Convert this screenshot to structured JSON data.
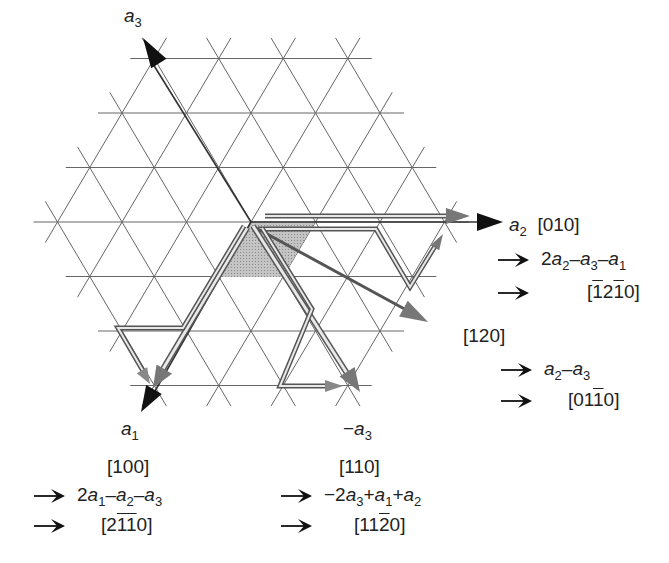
{
  "figure": {
    "lattice": {
      "type": "triangular",
      "center": [
        251,
        222
      ],
      "spacing_x": 64.5,
      "spacing_y": 54.5,
      "rings": 3,
      "line_color": "#555555"
    },
    "shaded_cell": {
      "fill": "#b8b8b8",
      "vertices": [
        [
          251,
          222
        ],
        [
          315,
          222
        ],
        [
          283,
          277
        ],
        [
          219,
          277
        ]
      ]
    }
  },
  "axes": {
    "a3": {
      "symbol": "a",
      "sub": "3"
    },
    "a2": {
      "symbol": "a",
      "sub": "2",
      "index3": "[010]",
      "expr": {
        "parts": [
          {
            "t": "2"
          },
          {
            "v": "a",
            "s": "2"
          },
          {
            "t": "–"
          },
          {
            "v": "a",
            "s": "3"
          },
          {
            "t": "–"
          },
          {
            "v": "a",
            "s": "1"
          }
        ]
      },
      "index4": {
        "parts": [
          {
            "t": "["
          },
          {
            "b": "1"
          },
          {
            "t": "2"
          },
          {
            "b": "1"
          },
          {
            "t": "0]"
          }
        ]
      }
    },
    "a1": {
      "symbol": "a",
      "sub": "1",
      "index3": "[100]",
      "expr": {
        "parts": [
          {
            "t": "2"
          },
          {
            "v": "a",
            "s": "1"
          },
          {
            "t": "–"
          },
          {
            "v": "a",
            "s": "2"
          },
          {
            "t": "–"
          },
          {
            "v": "a",
            "s": "3"
          }
        ]
      },
      "index4": {
        "parts": [
          {
            "t": "[2"
          },
          {
            "b": "1"
          },
          {
            "b": "1"
          },
          {
            "t": "0]"
          }
        ]
      }
    },
    "neg_a3": {
      "prefix": "−",
      "symbol": "a",
      "sub": "3",
      "index3": "[110]",
      "expr": {
        "parts": [
          {
            "t": "−2"
          },
          {
            "v": "a",
            "s": "3"
          },
          {
            "t": "+"
          },
          {
            "v": "a",
            "s": "1"
          },
          {
            "t": "+"
          },
          {
            "v": "a",
            "s": "2"
          }
        ]
      },
      "index4": {
        "parts": [
          {
            "t": "[11"
          },
          {
            "b": "2"
          },
          {
            "t": "0]"
          }
        ]
      }
    },
    "dir120": {
      "index3": "[120]",
      "expr": {
        "parts": [
          {
            "v": "a",
            "s": "2"
          },
          {
            "t": "–"
          },
          {
            "v": "a",
            "s": "3"
          }
        ]
      },
      "index4": {
        "parts": [
          {
            "t": "[01"
          },
          {
            "b": "1"
          },
          {
            "t": "0]"
          }
        ]
      }
    }
  },
  "labels": {
    "a3_symbol": "a",
    "a3_sub": "3",
    "a2_symbol": "a",
    "a2_sub": "2",
    "a2_index": "[010]",
    "a1_symbol": "a",
    "a1_sub": "1",
    "a1_index": "[100]",
    "neg_a3_prefix": "−",
    "neg_a3_symbol": "a",
    "neg_a3_sub": "3",
    "neg_a3_index": "[110]",
    "dir120_index": "[120]"
  }
}
